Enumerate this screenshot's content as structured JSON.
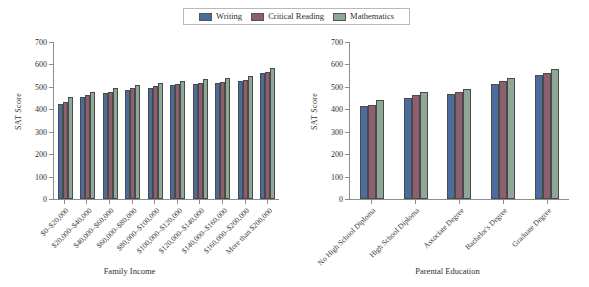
{
  "legend": {
    "entries": [
      {
        "label": "Writing",
        "color": "#4a6d9e"
      },
      {
        "label": "Critical Reading",
        "color": "#8d6070"
      },
      {
        "label": "Mathematics",
        "color": "#8fa896"
      }
    ]
  },
  "charts": [
    {
      "id": "family-income",
      "ylabel": "SAT Score",
      "xlabel": "Family Income",
      "yticks": [
        700,
        600,
        500,
        400,
        300,
        200,
        100,
        0
      ],
      "chart_data": {
        "type": "bar",
        "title": "",
        "xlabel": "Family Income",
        "ylabel": "SAT Score",
        "ylim": [
          0,
          700
        ],
        "grid": false,
        "legend_position": "top-center",
        "categories": [
          "$0–$20,000",
          "$20,000–$40,000",
          "$40,000–$60,000",
          "$60,000–$80,000",
          "$80,000–$100,000",
          "$100,000–$120,000",
          "$120,000–$140,000",
          "$140,000–$160,000",
          "$160,000–$200,000",
          "More than $200,000"
        ],
        "series": [
          {
            "name": "Writing",
            "values": [
              424,
              455,
              472,
              487,
              497,
              508,
              513,
              519,
              528,
              561
            ]
          },
          {
            "name": "Critical Reading",
            "values": [
              434,
              462,
              479,
              494,
              503,
              513,
              518,
              523,
              532,
              565
            ]
          },
          {
            "name": "Mathematics",
            "values": [
              456,
              477,
              493,
              508,
              518,
              528,
              534,
              540,
              550,
              586
            ]
          }
        ]
      }
    },
    {
      "id": "parental-education",
      "ylabel": "SAT Score",
      "xlabel": "Parental Education",
      "yticks": [
        700,
        600,
        500,
        400,
        300,
        200,
        100,
        0
      ],
      "chart_data": {
        "type": "bar",
        "title": "",
        "xlabel": "Parental Education",
        "ylabel": "SAT Score",
        "ylim": [
          0,
          700
        ],
        "grid": false,
        "legend_position": "top-center",
        "categories": [
          "No High School Diploma",
          "High School Diploma",
          "Associate Degree",
          "Bachelor's Degree",
          "Graduate Degree"
        ],
        "series": [
          {
            "name": "Writing",
            "values": [
              415,
              452,
              466,
              515,
              553
            ]
          },
          {
            "name": "Critical Reading",
            "values": [
              421,
              462,
              478,
              524,
              563
            ]
          },
          {
            "name": "Mathematics",
            "values": [
              442,
              475,
              489,
              538,
              580
            ]
          }
        ]
      }
    }
  ]
}
